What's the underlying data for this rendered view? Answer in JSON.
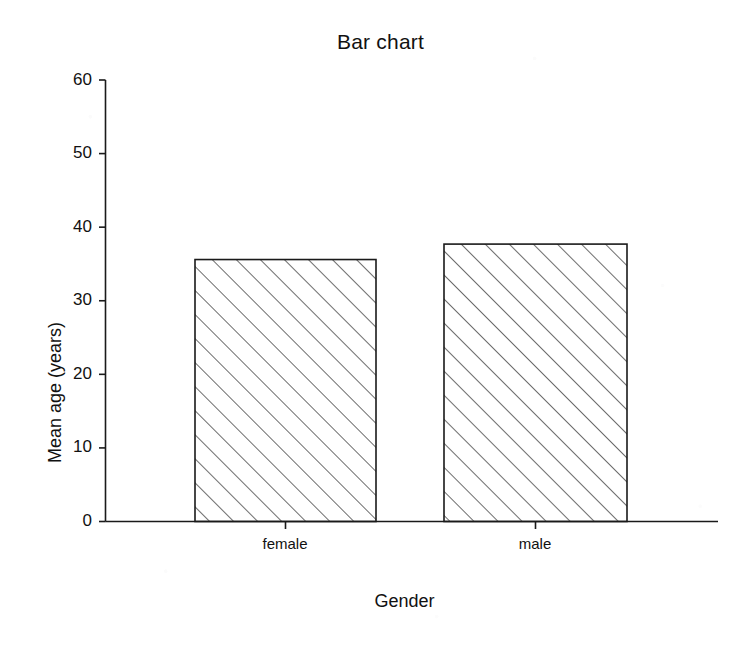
{
  "chart_data": {
    "type": "bar",
    "title": "Bar chart",
    "xlabel": "Gender",
    "ylabel": "Mean age (years)",
    "categories": [
      "female",
      "male"
    ],
    "values": [
      35.6,
      37.7
    ],
    "series": [
      {
        "name": "Mean age",
        "values": [
          35.6,
          37.7
        ]
      }
    ],
    "ylim": [
      0,
      60
    ],
    "yticks": [
      0,
      10,
      20,
      30,
      40,
      50,
      60
    ],
    "ytick_labels": [
      "0",
      "10",
      "20",
      "30",
      "40",
      "50",
      "60"
    ],
    "grid": false,
    "legend": false,
    "legend_position": "none",
    "bar_fill": "#ffffff",
    "bar_edge_color": "#1a1a1a",
    "bar_hatch": "diagonal-forward-slash",
    "background_color": "#ffffff",
    "axis_color": "#1a1a1a"
  },
  "figure": {
    "width": 753,
    "height": 649
  }
}
